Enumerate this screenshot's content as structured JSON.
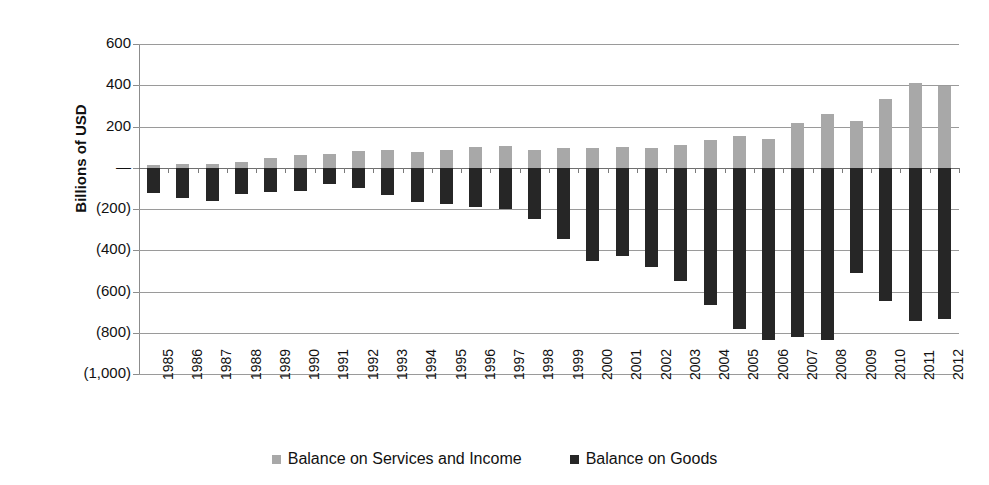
{
  "chart_data": {
    "type": "bar",
    "title": "",
    "subtitle": "",
    "xlabel": "",
    "ylabel": "Billions of USD",
    "ylim": [
      -1000,
      600
    ],
    "ytick_values": [
      600,
      400,
      200,
      0,
      -200,
      -400,
      -600,
      -800,
      -1000
    ],
    "ytick_labels": [
      "600",
      "400",
      "200",
      "—",
      "(200)",
      "(400)",
      "(600)",
      "(800)",
      "(1,000)"
    ],
    "grid": true,
    "stacked": false,
    "legend_position": "bottom",
    "categories": [
      "1985",
      "1986",
      "1987",
      "1988",
      "1989",
      "1990",
      "1991",
      "1992",
      "1993",
      "1994",
      "1995",
      "1996",
      "1997",
      "1998",
      "1999",
      "2000",
      "2001",
      "2002",
      "2003",
      "2004",
      "2005",
      "2006",
      "2007",
      "2008",
      "2009",
      "2010",
      "2011",
      "2012"
    ],
    "series": [
      {
        "name": "Balance on Services and Income",
        "color": "#a8a8a8",
        "values": [
          12,
          18,
          20,
          30,
          45,
          62,
          68,
          80,
          85,
          78,
          88,
          102,
          105,
          85,
          95,
          98,
          100,
          98,
          108,
          135,
          152,
          140,
          218,
          262,
          225,
          333,
          410,
          395
        ]
      },
      {
        "name": "Balance on Goods",
        "color": "#262626",
        "values": [
          -122,
          -145,
          -160,
          -127,
          -116,
          -111,
          -77,
          -97,
          -133,
          -166,
          -174,
          -191,
          -198,
          -248,
          -346,
          -452,
          -427,
          -482,
          -547,
          -666,
          -783,
          -837,
          -821,
          -834,
          -509,
          -645,
          -741,
          -735
        ]
      }
    ]
  },
  "legend": {
    "items": [
      {
        "label": "Balance on Services and Income",
        "color": "#a8a8a8",
        "swatch_name": "legend-swatch-services"
      },
      {
        "label": "Balance on Goods",
        "color": "#262626",
        "swatch_name": "legend-swatch-goods"
      }
    ]
  }
}
